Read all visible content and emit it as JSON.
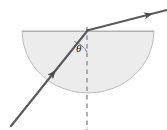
{
  "figure": {
    "background_color": "#ffffff",
    "labels": {
      "angle": "θ"
    },
    "colors": {
      "block_fill": "#ececec",
      "block_stroke": "#b3b3b3",
      "ray_stroke": "#59595c",
      "normal_stroke": "#8c8c8f",
      "label_color": "#1a1a1a"
    },
    "geometry": {
      "block": {
        "shape": "semicircle",
        "flat_side": "top",
        "center_x": 88,
        "flat_y": 31,
        "radius_x": 66,
        "radius_y": 62,
        "left_x": 22,
        "right_x": 154,
        "bottom_y": 93
      },
      "normal": {
        "style": "dashed",
        "x": 87,
        "y_top": 27,
        "y_bottom": 130
      },
      "incident_ray": {
        "from_x": 11,
        "from_y": 126,
        "to_x": 88,
        "to_y": 30,
        "arrow_at_x": 54,
        "arrow_at_y": 72,
        "direction": "up-right"
      },
      "refracted_ray": {
        "from_x": 88,
        "from_y": 30,
        "to_x": 167,
        "to_y": 10,
        "arrow_at_x": 150,
        "arrow_at_y": 14,
        "direction": "up-right"
      },
      "angle_arc": {
        "vertex_x": 88,
        "vertex_y": 30,
        "radius": 22,
        "between": [
          "incident_ray",
          "normal"
        ],
        "label_x": 79,
        "label_y": 51
      }
    }
  }
}
